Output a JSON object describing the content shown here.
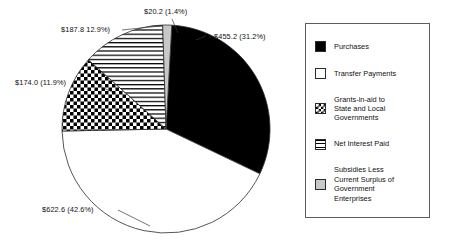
{
  "chart_data": {
    "type": "pie",
    "title": "",
    "units": "billions of dollars",
    "total": 1459.8,
    "legend_position": "right",
    "categories": [
      "Purchases",
      "Transfer Payments",
      "Grants-in-aid to State and Local Governments",
      "Net Interest Paid",
      "Subsidies Less Current Surplus of Government Enterprises"
    ],
    "values": [
      455.2,
      622.6,
      174.0,
      187.8,
      20.2
    ],
    "percents": [
      31.2,
      42.6,
      11.9,
      12.9,
      1.4
    ],
    "slices": [
      {
        "label": "Purchases",
        "value": 455.2,
        "percent": 31.2,
        "callout": "$455.2 (31.2%)",
        "pattern": "solid-black",
        "color": "#000000"
      },
      {
        "label": "Transfer Payments",
        "value": 622.6,
        "percent": 42.6,
        "callout": "$622.6 (42.6%)",
        "pattern": "empty-white",
        "color": "#ffffff"
      },
      {
        "label": "Grants-in-aid to State and Local Governments",
        "value": 174.0,
        "percent": 11.9,
        "callout": "$174.0 (11.9%)",
        "pattern": "checkerboard",
        "color": "#000000"
      },
      {
        "label": "Net Interest Paid",
        "value": 187.8,
        "percent": 12.9,
        "callout": "$187.8 12.9%)",
        "pattern": "horizontal-stripes",
        "color": "#000000"
      },
      {
        "label": "Subsidies Less Current Surplus of Government Enterprises",
        "value": 20.2,
        "percent": 1.4,
        "callout": "$20.2 (1.4%)",
        "pattern": "light-gray",
        "color": "#c8c8c8"
      }
    ]
  },
  "legend": {
    "items": [
      {
        "label": "Purchases",
        "pattern": "solid-black"
      },
      {
        "label": "Transfer Payments",
        "pattern": "empty-white"
      },
      {
        "label": "Grants-in-aid to\nState and Local\nGovernments",
        "pattern": "checkerboard"
      },
      {
        "label": "Net Interest Paid",
        "pattern": "horizontal-stripes"
      },
      {
        "label": "Subsidies Less\nCurrent Surplus of\nGovernment\nEnterprises",
        "pattern": "light-gray"
      }
    ]
  },
  "callouts": {
    "purchases": "$455.2 (31.2%)",
    "transfer_payments": "$622.6 (42.6%)",
    "grants_in_aid": "$174.0 (11.9%)",
    "net_interest_paid": "$187.8 12.9%)",
    "subsidies": "$20.2 (1.4%)"
  }
}
